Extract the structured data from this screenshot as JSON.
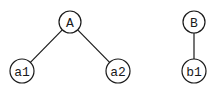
{
  "diagram": {
    "type": "tree",
    "trees": [
      {
        "root": "A",
        "children": [
          "a1",
          "a2"
        ]
      },
      {
        "root": "B",
        "children": [
          "b1"
        ]
      }
    ],
    "nodes": [
      {
        "id": "A",
        "label": "A",
        "x": 70,
        "y": 22,
        "r": 11
      },
      {
        "id": "a1",
        "label": "a1",
        "x": 22,
        "y": 71,
        "r": 12
      },
      {
        "id": "a2",
        "label": "a2",
        "x": 118,
        "y": 71,
        "r": 12
      },
      {
        "id": "B",
        "label": "B",
        "x": 194,
        "y": 22,
        "r": 11
      },
      {
        "id": "b1",
        "label": "b1",
        "x": 194,
        "y": 71,
        "r": 12
      }
    ],
    "edges": [
      {
        "from": "A",
        "to": "a1"
      },
      {
        "from": "A",
        "to": "a2"
      },
      {
        "from": "B",
        "to": "b1"
      }
    ]
  }
}
